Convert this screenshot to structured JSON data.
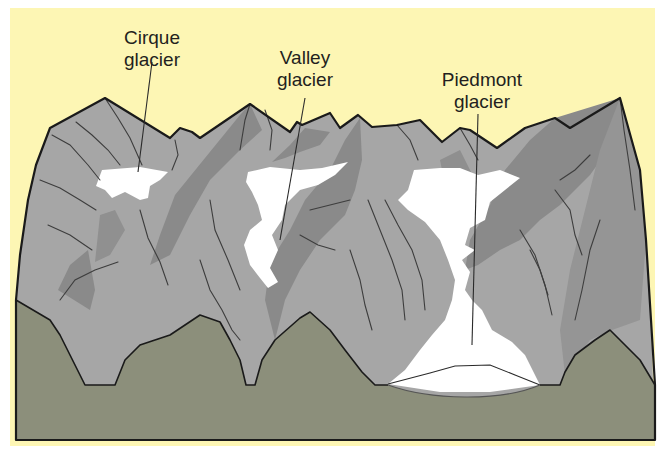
{
  "colors": {
    "sky": "#fdf6b4",
    "mountain_light": "#a9a9a9",
    "mountain_mid": "#959595",
    "mountain_dark": "#7e7e7e",
    "ice": "#ffffff",
    "ground": "#8c8f7b",
    "outline": "#1a1a1a"
  },
  "labels": [
    {
      "id": "cirque",
      "line1": "Cirque",
      "line2": "glacier"
    },
    {
      "id": "valley",
      "line1": "Valley",
      "line2": "glacier"
    },
    {
      "id": "piedmont",
      "line1": "Piedmont",
      "line2": "glacier"
    }
  ]
}
